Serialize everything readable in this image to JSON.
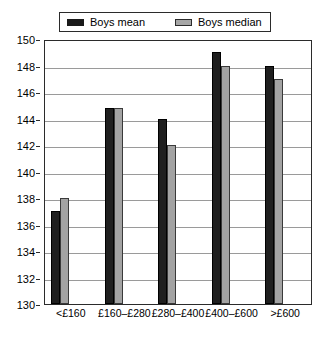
{
  "legend": {
    "entries": [
      {
        "label": "Boys mean",
        "swatch": "dark-square-swatch",
        "color": "#1f1f1f"
      },
      {
        "label": "Boys median",
        "swatch": "gray-square-swatch",
        "color": "#a3a3a3"
      }
    ]
  },
  "chart_data": {
    "type": "bar",
    "title": "",
    "xlabel": "",
    "ylabel": "",
    "ylim": [
      130,
      150
    ],
    "ytick_step": 2,
    "yticks": [
      130,
      132,
      134,
      136,
      138,
      140,
      142,
      144,
      146,
      148,
      150
    ],
    "ytick_labels": [
      "130",
      "132",
      "134",
      "136",
      "138",
      "140",
      "142",
      "144",
      "146",
      "148",
      "150"
    ],
    "grid": true,
    "legend_position": "top",
    "categories": [
      "<£160",
      "£160–£280",
      "£280–£400",
      "£400–£600",
      ">£600"
    ],
    "series": [
      {
        "name": "Boys mean",
        "color": "#1f1f1f",
        "values": [
          137,
          144.8,
          144,
          149,
          148
        ]
      },
      {
        "name": "Boys median",
        "color": "#a3a3a3",
        "values": [
          138,
          144.8,
          142,
          148,
          147
        ]
      }
    ]
  }
}
